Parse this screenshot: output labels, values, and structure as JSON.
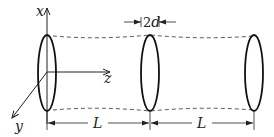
{
  "diagram": {
    "type": "periodic lens waveguide",
    "axes": {
      "x_label": "x",
      "y_label": "y",
      "z_label": "z"
    },
    "lenses": [
      {
        "id": "lens-1",
        "cx": 47
      },
      {
        "id": "lens-2",
        "cx": 150
      },
      {
        "id": "lens-3",
        "cx": 254
      }
    ],
    "dimensions": {
      "aperture_label_num": "2",
      "aperture_label_var": "d",
      "spacing_1": "L",
      "spacing_2": "L"
    },
    "colors": {
      "stroke": "#111111",
      "dashed": "#333333"
    }
  }
}
